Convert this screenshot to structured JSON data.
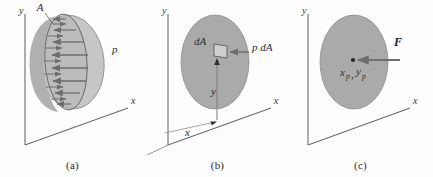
{
  "figure": {
    "background_color": "#fdfdfd",
    "panels": [
      {
        "id": "a",
        "caption": "(a)",
        "axes": {
          "y_label": "y",
          "x_label": "x"
        },
        "labels": [
          {
            "name": "area-label",
            "text": "A"
          },
          {
            "name": "pressure-label",
            "text": "p"
          }
        ],
        "arrow_count": 8,
        "description": "Tilted plane area A with distributed pressure p acting normal to the surface",
        "surface_fill": "#b3b3b3",
        "surface_fill_light": "#c4c4c4",
        "arrow_color": "#6e6e6e"
      },
      {
        "id": "b",
        "caption": "(b)",
        "axes": {
          "y_label": "y",
          "x_label": "x"
        },
        "labels": [
          {
            "name": "element-area-label",
            "text": "dA"
          },
          {
            "name": "element-force-label",
            "text": "p dA"
          },
          {
            "name": "y-distance-label",
            "text": "y"
          },
          {
            "name": "x-distance-label",
            "text": "x"
          }
        ],
        "description": "Differential area element dA with elemental force p dA located at coordinates x, y",
        "surface_fill": "#aaaaaa",
        "arrow_color": "#6e6e6e"
      },
      {
        "id": "c",
        "caption": "(c)",
        "axes": {
          "y_label": "y",
          "x_label": "x"
        },
        "labels": [
          {
            "name": "resultant-force-label",
            "text": "F"
          },
          {
            "name": "center-of-pressure-x-label",
            "text": "x"
          },
          {
            "name": "center-of-pressure-x-sub",
            "text": "p"
          },
          {
            "name": "center-of-pressure-comma",
            "text": ","
          },
          {
            "name": "center-of-pressure-y-label",
            "text": "y"
          },
          {
            "name": "center-of-pressure-y-sub",
            "text": "p"
          }
        ],
        "description": "Resultant force F acting at the center of pressure (x_p, y_p)",
        "surface_fill": "#aaaaaa",
        "arrow_color": "#6e6e6e"
      }
    ],
    "colors": {
      "axis": "#6b6b6b",
      "outline": "#5a5a5a",
      "text": "#2b2b2b",
      "fill_dark": "#a8a8a8",
      "fill_light": "#c6c6c6"
    }
  }
}
